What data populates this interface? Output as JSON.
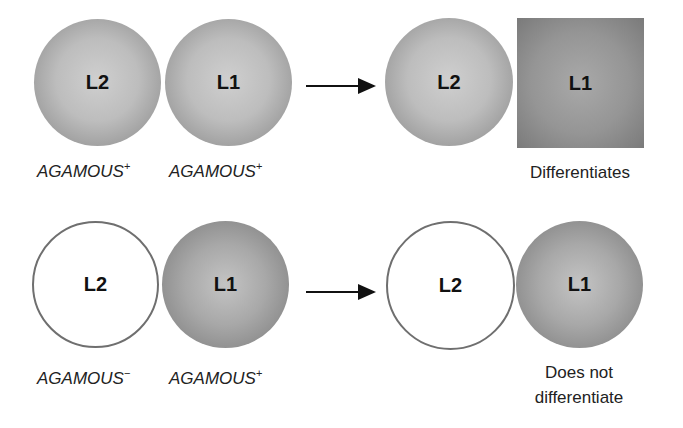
{
  "rows": [
    {
      "before": {
        "l2": {
          "label": "L2",
          "state": "filled",
          "gene": "AGAMOUS",
          "sign": "+"
        },
        "l1": {
          "label": "L1",
          "state": "filled",
          "gene": "AGAMOUS",
          "sign": "+"
        }
      },
      "after": {
        "l2": {
          "label": "L2",
          "shape": "circle"
        },
        "l1": {
          "label": "L1",
          "shape": "square"
        },
        "outcome": [
          "Differentiates"
        ]
      }
    },
    {
      "before": {
        "l2": {
          "label": "L2",
          "state": "empty",
          "gene": "AGAMOUS",
          "sign": "−"
        },
        "l1": {
          "label": "L1",
          "state": "filled",
          "gene": "AGAMOUS",
          "sign": "+"
        }
      },
      "after": {
        "l2": {
          "label": "L2",
          "shape": "empty-circle"
        },
        "l1": {
          "label": "L1",
          "shape": "circle"
        },
        "outcome": [
          "Does not",
          "differentiate"
        ]
      }
    }
  ],
  "colors": {
    "cell_fill": "#b5b5b5",
    "cell_outline": "#6f6f6f",
    "arrow": "#111111",
    "text": "#222222"
  }
}
